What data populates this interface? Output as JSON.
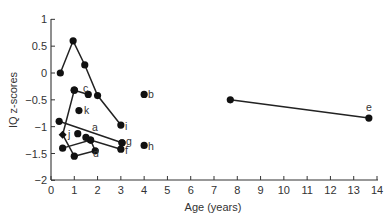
{
  "chart_data": {
    "type": "line",
    "title": "",
    "xlabel": "Age (years)",
    "ylabel": "IQ z-scores",
    "xlim": [
      0,
      14
    ],
    "ylim": [
      -2,
      1
    ],
    "x_ticks": [
      "0",
      "1",
      "2",
      "3",
      "4",
      "5",
      "6",
      "7",
      "8",
      "9",
      "10",
      "11",
      "12",
      "13",
      "14"
    ],
    "y_ticks": [
      "1",
      "0.5",
      "0",
      "−0.5",
      "−1",
      "−1.5",
      "−2"
    ],
    "grid": false,
    "legend": "none (series labeled inline with letters)",
    "series": [
      {
        "name": "i",
        "points": [
          [
            0.4,
            0.0
          ],
          [
            0.95,
            0.6
          ],
          [
            1.45,
            0.15
          ],
          [
            2.0,
            -0.42
          ],
          [
            3.0,
            -0.97
          ]
        ],
        "label_at": [
          3.0,
          -0.97
        ]
      },
      {
        "name": "c",
        "points": [
          [
            1.0,
            -0.32
          ],
          [
            1.6,
            -0.4
          ]
        ],
        "label_at": [
          1.5,
          -0.33
        ]
      },
      {
        "name": "diamond-series",
        "points": [
          [
            1.0,
            -0.32
          ],
          [
            0.5,
            -1.15
          ],
          [
            1.0,
            -1.55
          ]
        ],
        "markers": [
          "dot",
          "diamond",
          "tick"
        ]
      },
      {
        "name": "a",
        "points": [
          [
            0.35,
            -0.9
          ],
          [
            3.05,
            -1.3
          ]
        ],
        "label_at": [
          1.6,
          -1.05
        ]
      },
      {
        "name": "g",
        "points": [
          [
            3.05,
            -1.3
          ]
        ],
        "label_at": [
          3.05,
          -1.3
        ]
      },
      {
        "name": "f",
        "points": [
          [
            0.5,
            -1.4
          ],
          [
            1.7,
            -1.25
          ],
          [
            3.0,
            -1.42
          ]
        ],
        "label_at": [
          3.0,
          -1.42
        ]
      },
      {
        "name": "d",
        "points": [
          [
            1.0,
            -1.55
          ],
          [
            1.9,
            -1.45
          ],
          [
            1.7,
            -1.25
          ]
        ],
        "label_at": [
          1.9,
          -1.45
        ]
      },
      {
        "name": "j",
        "points": [
          [
            1.15,
            -1.13
          ],
          [
            1.5,
            -1.2
          ]
        ],
        "connected": false,
        "label_at": [
          1.15,
          -1.13
        ]
      },
      {
        "name": "k",
        "points": [
          [
            1.2,
            -0.7
          ]
        ],
        "label_at": [
          1.2,
          -0.7
        ]
      },
      {
        "name": "b",
        "points": [
          [
            4.0,
            -0.4
          ]
        ],
        "label_at": [
          4.0,
          -0.4
        ]
      },
      {
        "name": "h",
        "points": [
          [
            4.0,
            -1.35
          ]
        ],
        "label_at": [
          4.0,
          -1.35
        ]
      },
      {
        "name": "e",
        "points": [
          [
            7.7,
            -0.5
          ],
          [
            13.65,
            -0.84
          ]
        ],
        "label_at": [
          13.65,
          -0.84
        ]
      }
    ]
  },
  "axes": {
    "x_title": "Age (years)",
    "y_title": "IQ z-scores"
  },
  "labels": {
    "a": "a",
    "b": "b",
    "c": "c",
    "d": "d",
    "e": "e",
    "f": "f",
    "g": "g",
    "h": "h",
    "i": "i",
    "j": "j",
    "k": "k"
  }
}
